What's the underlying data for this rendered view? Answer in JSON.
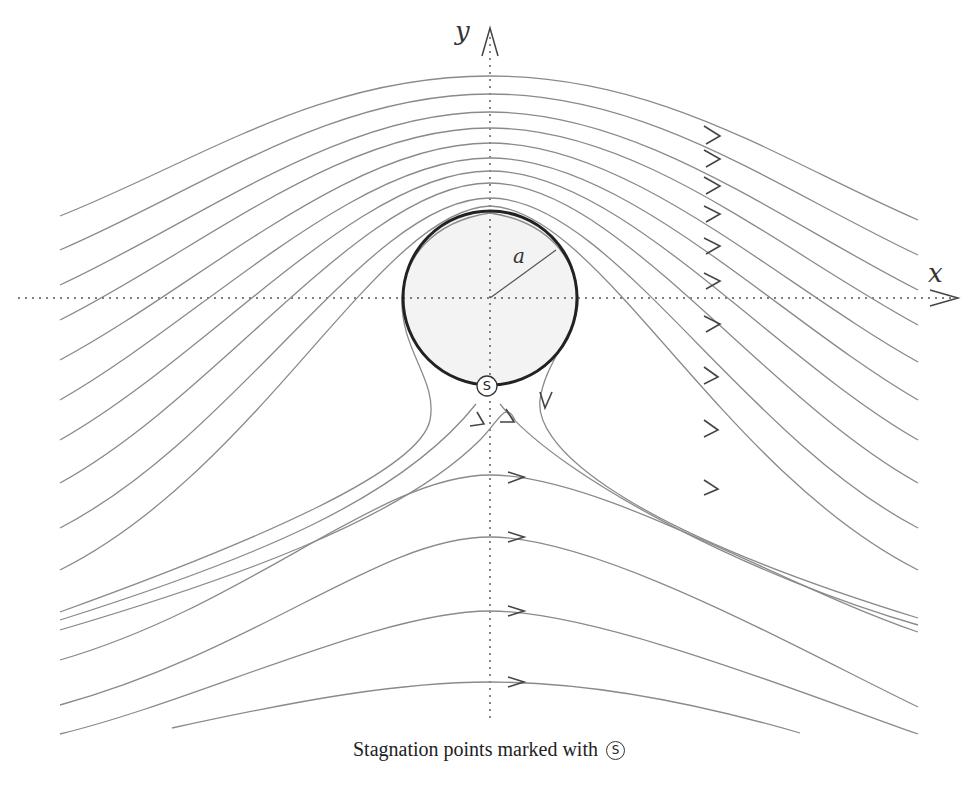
{
  "figure": {
    "axes": {
      "x_label": "x",
      "y_label": "y"
    },
    "cylinder": {
      "radius_label": "a",
      "center": [
        490,
        298
      ],
      "radius_px": 87
    },
    "stagnation_point": {
      "label": "S",
      "position": [
        487,
        385
      ]
    },
    "caption": {
      "text": "Stagnation points marked with",
      "symbol": "S"
    },
    "colors": {
      "streamline": "#8a8a8a",
      "cylinder_edge": "#222222",
      "cylinder_fill": "#f3f3f3",
      "axis": "#555555",
      "arrow": "#444444"
    }
  }
}
